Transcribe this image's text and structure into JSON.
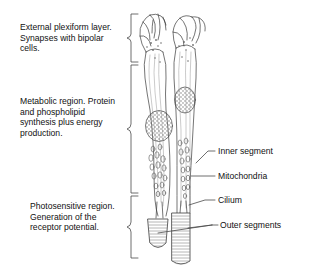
{
  "diagram": {
    "background_color": "#ffffff",
    "stroke_color": "#3a3a3a",
    "text_color": "#111111"
  },
  "left_annotations": [
    {
      "id": "external-plexiform",
      "lines": [
        "External plexiform layer.",
        "Synapses with bipolar",
        "cells."
      ],
      "bracket_top": 14,
      "bracket_bottom": 62
    },
    {
      "id": "metabolic-region",
      "lines": [
        "Metabolic region. Protein",
        "and phospholipid",
        "synthesis plus energy",
        "production."
      ],
      "bracket_top": 65,
      "bracket_bottom": 193
    },
    {
      "id": "photosensitive-region",
      "lines": [
        "Photosensitive region.",
        "Generation of the",
        "receptor potential."
      ],
      "bracket_top": 196,
      "bracket_bottom": 258
    }
  ],
  "right_labels": [
    {
      "id": "inner-segment",
      "text": "Inner segment"
    },
    {
      "id": "mitochondria",
      "text": "Mitochondria"
    },
    {
      "id": "cilium",
      "text": "Cilium"
    },
    {
      "id": "outer-segments",
      "text": "Outer segments"
    }
  ],
  "cell_parts": {
    "synaptic_terminal": "synaptic terminal",
    "cone_nucleus": "cone nucleus",
    "rod_nucleus": "rod nucleus",
    "cone_outer_segment": "cone outer segment",
    "rod_outer_segment": "rod outer segment"
  }
}
